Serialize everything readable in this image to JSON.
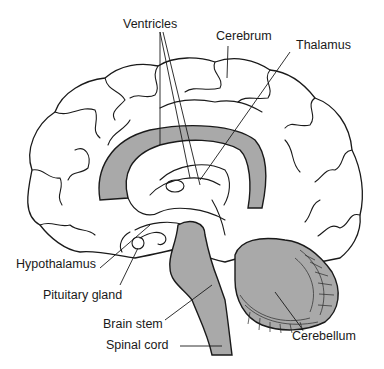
{
  "diagram": {
    "fill_color": "#a9a9a9",
    "line_color": "#1a1a1a",
    "labels": [
      {
        "id": "ventricles",
        "text": "Ventricles"
      },
      {
        "id": "cerebrum",
        "text": "Cerebrum"
      },
      {
        "id": "thalamus",
        "text": "Thalamus"
      },
      {
        "id": "hypothalamus",
        "text": "Hypothalamus"
      },
      {
        "id": "pituitary_gland",
        "text": "Pituitary gland"
      },
      {
        "id": "brain_stem",
        "text": "Brain stem"
      },
      {
        "id": "spinal_cord",
        "text": "Spinal cord"
      },
      {
        "id": "cerebellum",
        "text": "Cerebellum"
      }
    ]
  }
}
